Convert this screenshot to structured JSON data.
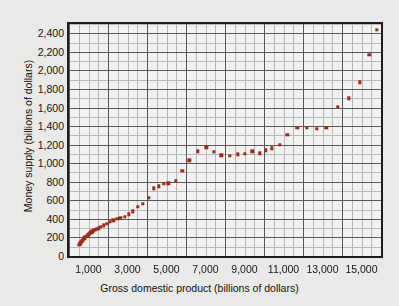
{
  "figure": {
    "background_color": "#e9e9e7",
    "plot_background_color": "#f2f2f0",
    "frame_color": "#1d1d1d",
    "marker_color": "#9e2b19",
    "gridline_minor_color": "#b9b9bd",
    "gridline_major_color": "#5a5a5e"
  },
  "chart_data": {
    "type": "scatter",
    "title": "",
    "subtitle": "",
    "xlabel": "Gross domestic product (billions of dollars)",
    "ylabel": "Money supply (billions of dollars)",
    "xlim": [
      0,
      16000
    ],
    "ylim": [
      0,
      2500
    ],
    "grid": true,
    "legend": null,
    "legend_position": "none",
    "x_major_step": 2000,
    "x_minor_step": 500,
    "y_major_step": 200,
    "y_minor_step": 100,
    "xticks": [
      1000,
      3000,
      5000,
      7000,
      9000,
      11000,
      13000,
      15000
    ],
    "xticklabels": [
      "1,000",
      "3,000",
      "5,000",
      "7,000",
      "9,000",
      "11,000",
      "13,000",
      "15,000"
    ],
    "yticks": [
      0,
      200,
      400,
      600,
      800,
      1000,
      1200,
      1400,
      1600,
      1800,
      2000,
      2200,
      2400
    ],
    "yticklabels": [
      "0",
      "200",
      "400",
      "600",
      "800",
      "1,000",
      "1,200",
      "1,400",
      "1,600",
      "1,800",
      "2,000",
      "2,200",
      "2,400"
    ],
    "series": [
      {
        "name": "Money supply vs GDP",
        "marker": "square",
        "color": "#9e2b19",
        "points": [
          [
            530,
            120
          ],
          [
            575,
            135
          ],
          [
            625,
            150
          ],
          [
            680,
            165
          ],
          [
            720,
            175
          ],
          [
            790,
            190
          ],
          [
            840,
            205
          ],
          [
            900,
            215
          ],
          [
            960,
            225
          ],
          [
            1020,
            235
          ],
          [
            1080,
            245
          ],
          [
            1140,
            255
          ],
          [
            1200,
            265
          ],
          [
            1270,
            275
          ],
          [
            1350,
            285
          ],
          [
            1430,
            292
          ],
          [
            1520,
            300
          ],
          [
            1620,
            312
          ],
          [
            1800,
            330
          ],
          [
            1940,
            348
          ],
          [
            2100,
            368
          ],
          [
            2280,
            385
          ],
          [
            2480,
            400
          ],
          [
            2630,
            410
          ],
          [
            2860,
            425
          ],
          [
            3080,
            450
          ],
          [
            3280,
            480
          ],
          [
            3530,
            528
          ],
          [
            3780,
            560
          ],
          [
            4100,
            625
          ],
          [
            4350,
            730
          ],
          [
            4600,
            752
          ],
          [
            4850,
            775
          ],
          [
            5100,
            782
          ],
          [
            5480,
            810
          ],
          [
            5820,
            918
          ],
          [
            6170,
            1030
          ],
          [
            6600,
            1130
          ],
          [
            7050,
            1170
          ],
          [
            7430,
            1122
          ],
          [
            7820,
            1085
          ],
          [
            8250,
            1078
          ],
          [
            8650,
            1095
          ],
          [
            9000,
            1098
          ],
          [
            9400,
            1130
          ],
          [
            9800,
            1105
          ],
          [
            10100,
            1140
          ],
          [
            10400,
            1160
          ],
          [
            10800,
            1200
          ],
          [
            11200,
            1305
          ],
          [
            11700,
            1380
          ],
          [
            12200,
            1382
          ],
          [
            12700,
            1368
          ],
          [
            13200,
            1380
          ],
          [
            13800,
            1605
          ],
          [
            14350,
            1700
          ],
          [
            14900,
            1870
          ],
          [
            15400,
            2165
          ],
          [
            15800,
            2440
          ]
        ]
      }
    ]
  }
}
